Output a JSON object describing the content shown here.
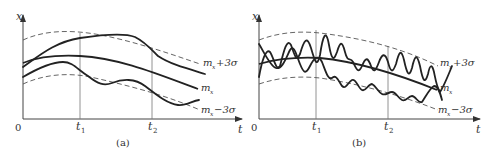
{
  "figure": {
    "panels": [
      {
        "id": "a",
        "caption": "(a)",
        "y_axis_label": "x",
        "x_axis_label": "t",
        "origin_label": "0",
        "time_markers": [
          "t1",
          "t2"
        ],
        "t1_label": "t",
        "t1_sub": "1",
        "t2_label": "t",
        "t2_sub": "2",
        "curves": {
          "upper_bound": "m_x+3σ",
          "mean": "m_x",
          "lower_bound": "m_x−3σ"
        },
        "description": "Smooth (low-frequency) sample realizations within ±3σ band"
      },
      {
        "id": "b",
        "caption": "(b)",
        "y_axis_label": "x",
        "x_axis_label": "t",
        "origin_label": "0",
        "time_markers": [
          "t1",
          "t2"
        ],
        "t1_label": "t",
        "t1_sub": "1",
        "t2_label": "t",
        "t2_sub": "2",
        "curves": {
          "upper_bound": "m_x+3σ",
          "mean": "m_x",
          "lower_bound": "m_x−3σ"
        },
        "description": "Rapidly oscillating (high-frequency) sample realizations within ±3σ band"
      }
    ],
    "labels": {
      "m": "m",
      "sub_x": "x",
      "plus3s": "+3σ",
      "minus3s": "−3σ"
    }
  }
}
